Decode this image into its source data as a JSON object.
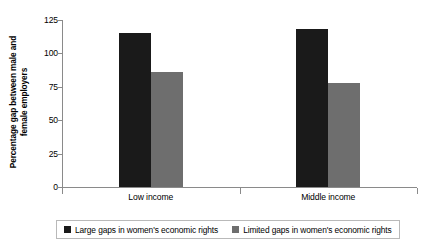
{
  "chart_data": {
    "type": "bar",
    "title": "",
    "xlabel": "",
    "ylabel": "Percentage gap between male and female employers",
    "ylabel_line1": "Percentage gap between male and",
    "ylabel_line2": "female employers",
    "categories": [
      "Low income",
      "Middle income"
    ],
    "series": [
      {
        "name": "Large gaps in women's economic rights",
        "color": "#1a1a1a",
        "values": [
          115,
          118
        ]
      },
      {
        "name": "Limited gaps in women's economic rights",
        "color": "#6e6e6e",
        "values": [
          86,
          78
        ]
      }
    ],
    "ylim": [
      0,
      125
    ],
    "yticks": [
      0,
      25,
      50,
      75,
      100,
      125
    ],
    "ytick_labels": [
      "0",
      "25",
      "50",
      "75",
      "100",
      "125"
    ],
    "grid": false,
    "legend_position": "bottom"
  },
  "legend": {
    "items": [
      {
        "label": "Large gaps in women's economic rights",
        "color": "#1a1a1a"
      },
      {
        "label": "Limited gaps in women's economic rights",
        "color": "#6e6e6e"
      }
    ]
  },
  "colors": {
    "dark_bar": "#1a1a1a",
    "light_bar": "#6e6e6e",
    "axis": "#8a8a8a",
    "legend_border": "#b9b9b9",
    "background": "#ffffff"
  }
}
